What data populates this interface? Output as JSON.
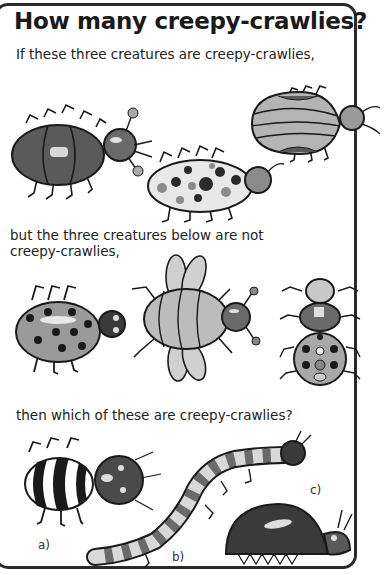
{
  "title": "How many creepy-crawlies?",
  "sections": {
    "intro": "If these three creatures are creepy-crawlies,",
    "not_text_line1": "but the three creatures below are not",
    "not_text_line2": "creepy-crawlies,",
    "question": "then which of these are creepy-crawlies?"
  },
  "creatures": {
    "yes": [
      {
        "id": "striped-beetle",
        "pattern": "bands"
      },
      {
        "id": "spotted-bug",
        "pattern": "spots"
      },
      {
        "id": "stripe-shell-bug",
        "pattern": "stripes"
      }
    ],
    "no": [
      {
        "id": "spotted-round-bug",
        "pattern": "spots"
      },
      {
        "id": "winged-bee",
        "pattern": "wings"
      },
      {
        "id": "segmented-bug",
        "pattern": "segments"
      }
    ],
    "options": [
      {
        "label": "a)",
        "id": "striped-big-head-bug"
      },
      {
        "label": "b)",
        "id": "banded-centipede"
      },
      {
        "label": "c)",
        "id": "dome-beetle"
      }
    ]
  },
  "colors": {
    "dark": "#3a3a3a",
    "mid": "#8a8a8a",
    "light": "#c8c8c8",
    "outline": "#1a1a1a"
  }
}
